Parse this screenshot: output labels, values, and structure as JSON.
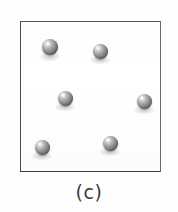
{
  "figure": {
    "caption": "(c)",
    "panel_label": "(c)",
    "background_color": "#ffffff",
    "container": {
      "name": "square container",
      "border_color": "#4a4a4a",
      "fill_color": "#ffffff",
      "x": 20,
      "y": 21,
      "width": 141,
      "height": 151
    },
    "particle_style": {
      "shape": "sphere",
      "color": "#8f8f8f",
      "highlight_color": "#f2f2f2",
      "shadow_color": "#3e3e3e",
      "diameter": 15
    },
    "particle_count": 6,
    "particles": [
      {
        "id": "particle-1",
        "cx": 50,
        "cy": 47,
        "d": 16
      },
      {
        "id": "particle-2",
        "cx": 100,
        "cy": 51,
        "d": 15
      },
      {
        "id": "particle-3",
        "cx": 65,
        "cy": 98,
        "d": 15
      },
      {
        "id": "particle-4",
        "cx": 144,
        "cy": 101,
        "d": 15
      },
      {
        "id": "particle-5",
        "cx": 42,
        "cy": 147,
        "d": 15
      },
      {
        "id": "particle-6",
        "cx": 110,
        "cy": 143,
        "d": 15
      }
    ]
  }
}
